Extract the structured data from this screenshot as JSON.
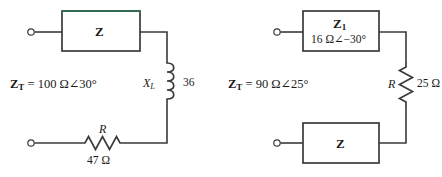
{
  "figure": {
    "kind": "circuit-diagram",
    "colors": {
      "wire": "#3a3a3a",
      "box_border": "#3a3a3a",
      "box_accent_green": "#2f6b4f",
      "text": "#1a1a1a",
      "background": "#ffffff"
    },
    "circuits": [
      {
        "id": "left-circuit",
        "total_impedance_label": {
          "symbol": "Z",
          "subscript": "T",
          "equals": "=",
          "value": "100 Ω∠30°",
          "full_text": "Zᴛ = 100 Ω∠30°"
        },
        "unknown_box": {
          "label": "Z",
          "accent": "green-top-edge"
        },
        "components": [
          {
            "type": "inductor",
            "symbol": "X",
            "subscript": "L",
            "value": "36",
            "orientation": "vertical"
          },
          {
            "type": "resistor",
            "symbol": "R",
            "value": "47 Ω",
            "orientation": "horizontal"
          }
        ],
        "terminals": [
          "top-left-terminal",
          "bottom-left-terminal"
        ]
      },
      {
        "id": "right-circuit",
        "total_impedance_label": {
          "symbol": "Z",
          "subscript": "T",
          "equals": "=",
          "value": "90 Ω∠25°",
          "full_text": "Zᴛ = 90 Ω∠25°"
        },
        "known_box": {
          "label": "Z",
          "subscript": "1",
          "value": "16 Ω∠−30°"
        },
        "unknown_box": {
          "label": "Z"
        },
        "components": [
          {
            "type": "resistor",
            "symbol": "R",
            "value": "25 Ω",
            "orientation": "vertical"
          }
        ],
        "terminals": [
          "top-left-terminal",
          "bottom-left-terminal"
        ]
      }
    ]
  }
}
